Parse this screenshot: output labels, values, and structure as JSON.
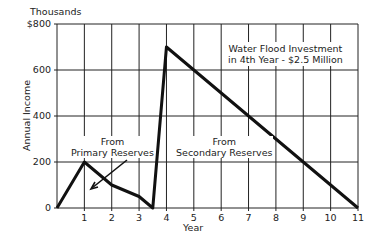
{
  "chart_data": {
    "type": "line",
    "title": "",
    "xlabel": "Year",
    "ylabel": "Annual Income",
    "y_unit_label": "Thousands",
    "xlim": [
      0,
      11
    ],
    "ylim": [
      0,
      800
    ],
    "grid": true,
    "x_ticks": [
      "1",
      "2",
      "3",
      "4",
      "5",
      "6",
      "7",
      "8",
      "9",
      "10",
      "11"
    ],
    "y_ticks": [
      "0",
      "200",
      "400",
      "600",
      "$800"
    ],
    "series": [
      {
        "name": "Annual Income",
        "x": [
          0,
          1,
          2,
          3,
          3.5,
          4,
          11
        ],
        "y": [
          0,
          200,
          100,
          50,
          0,
          700,
          0
        ]
      }
    ],
    "annotations": [
      {
        "text_line1": "Water Flood Investment",
        "text_line2": "in 4th Year - $2.5 Million"
      },
      {
        "text_line1": "From",
        "text_line2": "Primary Reserves"
      },
      {
        "text_line1": "From",
        "text_line2": "Secondary Reserves"
      }
    ]
  }
}
